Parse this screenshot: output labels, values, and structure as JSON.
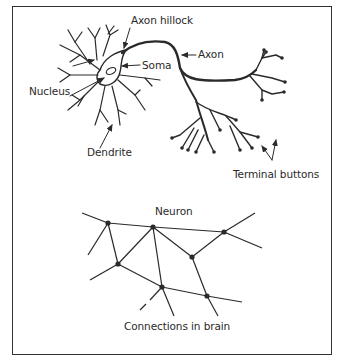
{
  "neuron_diagram": {
    "labels": {
      "axon_hillock": "Axon hillock",
      "axon": "Axon",
      "soma": "Soma",
      "nucleus": "Nucleus",
      "dendrite": "Dendrite",
      "terminal_buttons": "Terminal buttons"
    }
  },
  "network_diagram": {
    "title": "Neuron",
    "caption": "Connections in brain"
  },
  "colors": {
    "stroke": "#2a2a2a",
    "background": "#ffffff",
    "frame": "#333333"
  }
}
